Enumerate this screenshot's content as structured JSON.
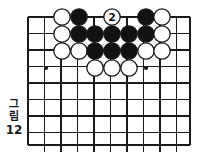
{
  "figure": {
    "caption_text": "그림",
    "caption_chars": [
      "그",
      "림"
    ],
    "caption_number": "12",
    "kind": "go-board-diagram"
  },
  "board": {
    "line_color": "#1a1a1a",
    "background_color": "#ffffff",
    "edge_line_width": 2.2,
    "inner_line_width": 1.3,
    "left": 28,
    "top": 17,
    "right": 190,
    "bottom": 145,
    "spacing": 16.5,
    "cols": 10,
    "rows": 8,
    "star_points": [
      {
        "x": 46,
        "y": 68
      },
      {
        "x": 146,
        "y": 68
      }
    ],
    "star_radius": 2.1,
    "bottom_stub_length": 7,
    "top_stub_length": 0
  },
  "stones": {
    "radius": 8.2,
    "black_fill": "#121212",
    "white_fill": "#ffffff",
    "outline_color": "#1a1a1a",
    "outline_width": 1.3,
    "items": [
      {
        "id": "s1",
        "color": "white",
        "x": 62,
        "y": 17,
        "label": ""
      },
      {
        "id": "s2",
        "color": "black",
        "x": 79,
        "y": 17,
        "label": ""
      },
      {
        "id": "s3",
        "color": "white",
        "x": 112,
        "y": 17,
        "label": "2"
      },
      {
        "id": "s4",
        "color": "black",
        "x": 146,
        "y": 17,
        "label": ""
      },
      {
        "id": "s5",
        "color": "white",
        "x": 162,
        "y": 17,
        "label": ""
      },
      {
        "id": "s6",
        "color": "white",
        "x": 62,
        "y": 34,
        "label": ""
      },
      {
        "id": "s7",
        "color": "black",
        "x": 79,
        "y": 34,
        "label": ""
      },
      {
        "id": "s8",
        "color": "black",
        "x": 95,
        "y": 34,
        "label": ""
      },
      {
        "id": "s9",
        "color": "black",
        "x": 112,
        "y": 34,
        "label": ""
      },
      {
        "id": "s10",
        "color": "black",
        "x": 129,
        "y": 34,
        "label": ""
      },
      {
        "id": "s11",
        "color": "black",
        "x": 146,
        "y": 34,
        "label": ""
      },
      {
        "id": "s12",
        "color": "white",
        "x": 162,
        "y": 34,
        "label": ""
      },
      {
        "id": "s13",
        "color": "white",
        "x": 62,
        "y": 51,
        "label": ""
      },
      {
        "id": "s14",
        "color": "white",
        "x": 79,
        "y": 51,
        "label": ""
      },
      {
        "id": "s15",
        "color": "black",
        "x": 95,
        "y": 51,
        "label": ""
      },
      {
        "id": "s16",
        "color": "black",
        "x": 112,
        "y": 51,
        "label": ""
      },
      {
        "id": "s17",
        "color": "black",
        "x": 129,
        "y": 51,
        "label": ""
      },
      {
        "id": "s18",
        "color": "white",
        "x": 146,
        "y": 51,
        "label": ""
      },
      {
        "id": "s19",
        "color": "white",
        "x": 162,
        "y": 51,
        "label": ""
      },
      {
        "id": "s20",
        "color": "white",
        "x": 95,
        "y": 68,
        "label": ""
      },
      {
        "id": "s21",
        "color": "white",
        "x": 112,
        "y": 68,
        "label": ""
      },
      {
        "id": "s22",
        "color": "white",
        "x": 129,
        "y": 68,
        "label": ""
      }
    ]
  },
  "move_markers": [
    {
      "number": "2",
      "on_stone": "s3",
      "text_color": "#121212"
    }
  ]
}
